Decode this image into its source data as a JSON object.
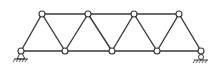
{
  "diagram": {
    "type": "warren-truss",
    "colors": {
      "member": "#3a3a3a",
      "node_fill": "#ffffff",
      "node_stroke": "#333333",
      "background": "#ffffff"
    },
    "nodes": {
      "bottom": [
        [
          21,
          51
        ],
        [
          65,
          51
        ],
        [
          112,
          51
        ],
        [
          157,
          51
        ],
        [
          201,
          51
        ]
      ],
      "top": [
        [
          42,
          14
        ],
        [
          88,
          14
        ],
        [
          134,
          14
        ],
        [
          179,
          14
        ]
      ]
    },
    "node_radius": 3,
    "supports": [
      {
        "name": "left-pin-support",
        "kind": "pin",
        "at": [
          21,
          51
        ]
      },
      {
        "name": "right-roller-support",
        "kind": "roller",
        "at": [
          201,
          51
        ]
      }
    ]
  }
}
